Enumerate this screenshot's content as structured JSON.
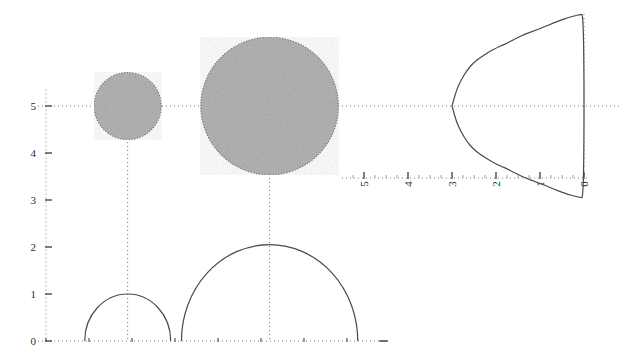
{
  "figure": {
    "title": "",
    "background": "#ffffff",
    "width": 619,
    "height": 360,
    "axis_color": "#555555",
    "curve_color": "#4a4a4a",
    "disk_fill": "#aaaaaa",
    "disk_edge": "#666666",
    "dotted_color": "#7a7a7a"
  },
  "chart_data": {
    "type": "scatter",
    "title": "",
    "xlabel": "",
    "ylabel": "",
    "panels": [
      {
        "name": "main-panel",
        "xlim": [
          0,
          8.2
        ],
        "ylim": [
          0,
          5.6
        ],
        "grid": false,
        "yticks": [
          0,
          1,
          2,
          3,
          4,
          5
        ],
        "ytick_labels": [
          "0",
          "1",
          "2",
          "3",
          "4",
          "5"
        ],
        "xticks": [
          0,
          1,
          2,
          3,
          4,
          5,
          6,
          7,
          8
        ],
        "xtick_labels": [
          "",
          "",
          "",
          "",
          "",
          "",
          "",
          "",
          ""
        ],
        "disks": [
          {
            "name": "small-disk",
            "cx": 1.9,
            "cy": 5.0,
            "r": 0.78,
            "label": ""
          },
          {
            "name": "large-disk",
            "cx": 5.2,
            "cy": 5.0,
            "r": 1.6,
            "label": ""
          }
        ],
        "arcs": [
          {
            "name": "small-semicircle",
            "cx": 1.9,
            "cy": 0.0,
            "r": 1.0,
            "peak": 1.0
          },
          {
            "name": "large-semicircle",
            "cx": 5.2,
            "cy": 0.0,
            "r": 2.05,
            "peak": 2.05
          }
        ],
        "guides": [
          {
            "name": "horizontal-guide-y5",
            "orientation": "horizontal",
            "value": 5.0
          },
          {
            "name": "vertical-guide-small",
            "orientation": "vertical",
            "value": 1.9
          },
          {
            "name": "vertical-guide-large",
            "orientation": "vertical",
            "value": 5.2
          }
        ]
      },
      {
        "name": "side-panel",
        "orientation": "rotated-90",
        "xticks": [
          5,
          4,
          3,
          2,
          1,
          0
        ],
        "xtick_labels": [
          "5",
          "4",
          "3",
          "2",
          "1",
          "0"
        ],
        "ylim": [
          0,
          5.6
        ],
        "grid": false,
        "guides": [
          {
            "name": "horizontal-guide-y5",
            "orientation": "horizontal",
            "value": 5.0
          },
          {
            "name": "vertical-guide-zero",
            "orientation": "vertical",
            "value": 0.0
          }
        ],
        "profile_label": "",
        "profile": {
          "description": "symmetric lobed profile about the y=5 line",
          "r_values": [
            0.0,
            0.1,
            0.22,
            0.36,
            0.52,
            0.7,
            0.9,
            1.12,
            1.34,
            1.52,
            1.66,
            1.76,
            1.86,
            1.98,
            2.14,
            2.34,
            2.52,
            2.66,
            2.78,
            2.9,
            3.0
          ],
          "t_values": [
            3.0,
            2.98,
            2.94,
            2.88,
            2.8,
            2.7,
            2.58,
            2.46,
            2.34,
            2.22,
            2.12,
            2.04,
            1.98,
            1.9,
            1.78,
            1.6,
            1.4,
            1.16,
            0.88,
            0.52,
            0.0
          ]
        }
      }
    ]
  },
  "labels": {
    "main_y": [
      "0",
      "1",
      "2",
      "3",
      "4",
      "5"
    ],
    "side_x": [
      "5",
      "4",
      "3",
      "2",
      "1",
      "0"
    ]
  }
}
